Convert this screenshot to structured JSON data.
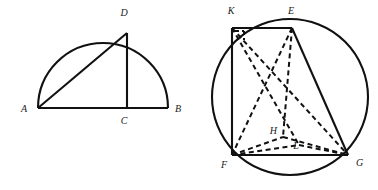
{
  "figure": {
    "background_color": "#ffffff",
    "stroke_color": "#111111",
    "label_color": "#1a1a1a"
  },
  "left_figure": {
    "name": "semicircle-diagram",
    "description": "Semicircle on diameter AB with altitude DC and chord AD",
    "labels": {
      "a": "A",
      "b": "B",
      "c": "C",
      "d": "D"
    },
    "points": {
      "A": {
        "x": 38,
        "y": 108
      },
      "B": {
        "x": 168,
        "y": 108
      },
      "C": {
        "x": 127,
        "y": 108
      },
      "D": {
        "x": 127,
        "y": 33
      }
    },
    "label_positions": {
      "A": {
        "x": 21,
        "y": 112
      },
      "B": {
        "x": 175,
        "y": 112
      },
      "C": {
        "x": 124,
        "y": 124
      },
      "D": {
        "x": 124,
        "y": 16
      },
      "anchors": {
        "A": "start",
        "B": "start",
        "C": "middle",
        "D": "middle"
      }
    },
    "semicircle": {
      "center_x": 103,
      "center_y": 108,
      "radius": 65
    },
    "segments": [
      {
        "name": "diameter-AB",
        "from": "A",
        "to": "B",
        "style": "solid"
      },
      {
        "name": "chord-AD",
        "from": "A",
        "to": "D",
        "style": "solid"
      },
      {
        "name": "altitude-DC",
        "from": "D",
        "to": "C",
        "style": "solid"
      }
    ],
    "stroke_width": 2.1
  },
  "right_figure": {
    "name": "circle-rectangle-diagram",
    "description": "Circle with inscribed rectangle KEGF and dashed interior segments through points H and L",
    "labels": {
      "k": "K",
      "e": "E",
      "f": "F",
      "g": "G",
      "h": "H",
      "l": "L"
    },
    "points": {
      "K": {
        "x": 232,
        "y": 28
      },
      "E": {
        "x": 292,
        "y": 28
      },
      "F": {
        "x": 232,
        "y": 155
      },
      "G": {
        "x": 348,
        "y": 155
      },
      "H": {
        "x": 283,
        "y": 137
      },
      "L": {
        "x": 299,
        "y": 145
      }
    },
    "label_positions": {
      "K": {
        "x": 231,
        "y": 14
      },
      "E": {
        "x": 291,
        "y": 14
      },
      "F": {
        "x": 224,
        "y": 168
      },
      "G": {
        "x": 356,
        "y": 166
      },
      "H": {
        "x": 277,
        "y": 134
      },
      "L": {
        "x": 296,
        "y": 149
      },
      "anchors": {
        "K": "middle",
        "E": "middle",
        "F": "middle",
        "G": "start",
        "H": "end",
        "L": "middle"
      }
    },
    "circle": {
      "center_x": 290,
      "center_y": 97,
      "radius": 78
    },
    "solid_segments": [
      {
        "name": "edge-KE",
        "from": "K",
        "to": "E"
      },
      {
        "name": "edge-KF",
        "from": "K",
        "to": "F"
      },
      {
        "name": "edge-FG",
        "from": "F",
        "to": "G"
      },
      {
        "name": "edge-EG",
        "from": "E",
        "to": "G"
      }
    ],
    "dashed_segments": [
      {
        "name": "segment-KG",
        "from": "K",
        "to": "G"
      },
      {
        "name": "segment-KL",
        "from": "K",
        "to": "L"
      },
      {
        "name": "segment-EF",
        "from": "E",
        "to": "F"
      },
      {
        "name": "segment-EH",
        "from": "E",
        "to": "H"
      },
      {
        "name": "segment-FH",
        "from": "F",
        "to": "H"
      },
      {
        "name": "segment-FL",
        "from": "F",
        "to": "L"
      },
      {
        "name": "segment-HG",
        "from": "H",
        "to": "G"
      },
      {
        "name": "segment-LG",
        "from": "L",
        "to": "G"
      }
    ],
    "right_angle_mark": {
      "name": "right-angle-mark-K",
      "vertex": "K",
      "size": 9
    },
    "stroke_width_solid": 2.1,
    "stroke_width_dashed": 2.0,
    "dash_pattern": "5,3.5"
  }
}
